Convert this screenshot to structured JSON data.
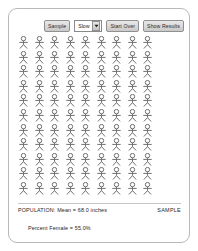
{
  "panel": {
    "name": "sampling-applet-panel"
  },
  "toolbar": {
    "sample_button_label": "Sample",
    "speed_select": {
      "value": "Slow",
      "options": [
        "Slow",
        "Fast",
        "Batch"
      ],
      "arrow_icon": "chevron-down-icon"
    },
    "start_over_button_label": "Start Over",
    "show_results_button_label": "Show Results"
  },
  "population": {
    "icon_name": "person-figure-icon",
    "columns": 9,
    "rows": 11,
    "total_figures": 99,
    "figure_color": "#6f6f6f"
  },
  "footer": {
    "population_stat": "POPULATION: Mean = 68.0 inches",
    "percent_female_stat": "Percent Female = 55.0%",
    "sample_label": "SAMPLE"
  }
}
